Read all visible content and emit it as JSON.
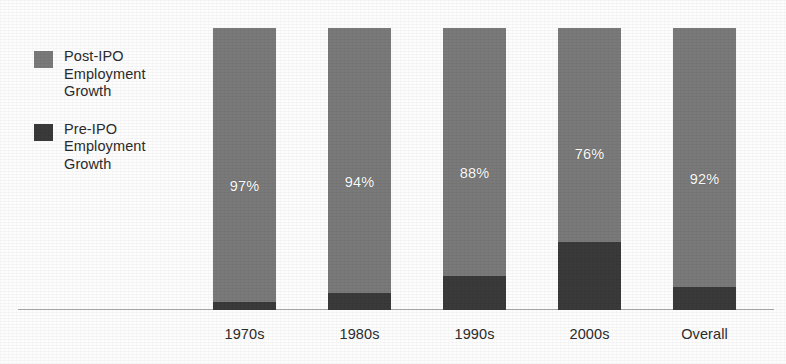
{
  "chart_data": {
    "type": "bar",
    "subtype": "stacked-bar-100",
    "title": "",
    "subtitle": "",
    "xlabel": "",
    "ylabel": "",
    "ylim": [
      0,
      100
    ],
    "grid": false,
    "legend_position": "left",
    "categories": [
      "1970s",
      "1980s",
      "1990s",
      "2000s",
      "Overall"
    ],
    "series": [
      {
        "name": "Post-IPO Employment Growth",
        "color": "#7a7a7a",
        "values": [
          97,
          94,
          88,
          76,
          92
        ],
        "labels": [
          "97%",
          "94%",
          "88%",
          "76%",
          "92%"
        ]
      },
      {
        "name": "Pre-IPO Employment Growth",
        "color": "#3a3a3a",
        "values": [
          3,
          6,
          12,
          24,
          8
        ],
        "labels": [
          "",
          "",
          "",
          "",
          ""
        ]
      }
    ],
    "annotations": []
  },
  "legend": {
    "items": [
      {
        "label": "Post-IPO\nEmployment\nGrowth",
        "color": "#7a7a7a",
        "swatch_name": "legend-swatch-post-ipo"
      },
      {
        "label": "Pre-IPO\nEmployment\nGrowth",
        "color": "#3a3a3a",
        "swatch_name": "legend-swatch-pre-ipo"
      }
    ]
  },
  "axis": {
    "tick_labels": [
      "1970s",
      "1980s",
      "1990s",
      "2000s",
      "Overall"
    ]
  },
  "colors": {
    "post_ipo": "#7a7a7a",
    "pre_ipo": "#3a3a3a",
    "axis_line": "#a9a9a9",
    "text": "#2b2b2b",
    "value_text": "#ffffff",
    "background": "#fdfdfd"
  }
}
